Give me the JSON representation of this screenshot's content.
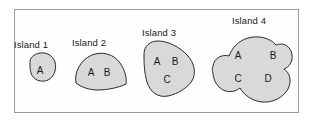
{
  "figure": {
    "background_color": "#ffffff",
    "frame": {
      "name": "outer-frame",
      "fill": "#fefefe",
      "stroke": "#9a9a9a",
      "x": 14,
      "y": 9,
      "width": 284,
      "height": 103
    },
    "island_fill": "#d9d9d9",
    "island_stroke": "#2b2b2b",
    "text_color": "#1a1a1a"
  },
  "islands": [
    {
      "label": "Island 1",
      "label_x": 14,
      "label_y": 48,
      "letters": [
        {
          "text": "A",
          "x": 40,
          "y": 74
        }
      ]
    },
    {
      "label": "Island 2",
      "label_x": 72,
      "label_y": 46,
      "letters": [
        {
          "text": "A",
          "x": 91,
          "y": 76
        },
        {
          "text": "B",
          "x": 107,
          "y": 76
        }
      ]
    },
    {
      "label": "Island 3",
      "label_x": 142,
      "label_y": 36,
      "letters": [
        {
          "text": "A",
          "x": 157,
          "y": 65
        },
        {
          "text": "B",
          "x": 175,
          "y": 65
        },
        {
          "text": "C",
          "x": 167,
          "y": 83
        }
      ]
    },
    {
      "label": "Island 4",
      "label_x": 232,
      "label_y": 24,
      "letters": [
        {
          "text": "A",
          "x": 238,
          "y": 59
        },
        {
          "text": "B",
          "x": 273,
          "y": 59
        },
        {
          "text": "C",
          "x": 238,
          "y": 82
        },
        {
          "text": "D",
          "x": 268,
          "y": 82
        }
      ]
    }
  ],
  "shapes": {
    "island1_path": "M 30,64 C 29,58 34,54 40,53 C 47,52 53,56 55,62 C 57,69 54,77 48,80 C 41,83 33,80 31,73 C 30,70 30,67 30,64 Z",
    "island2_path": "M 76,83 C 74,73 80,60 92,55 C 102,51 114,54 120,63 C 125,70 127,78 126,84 C 118,88 106,90 98,90 C 89,90 81,87 76,83 Z",
    "island3_path": "M 144,54 C 144,46 150,41 158,41 C 168,41 180,47 188,56 C 194,63 196,72 193,79 C 189,87 178,94 168,96 C 158,98 150,92 147,82 C 144,72 144,62 144,54 Z",
    "island4_path": "M 213,66 C 214,58 222,54 229,56 C 232,48 238,41 248,38 C 259,35 270,38 276,45 C 283,42 291,46 292,55 C 293,62 289,67 284,69 C 290,73 292,81 288,89 C 283,98 272,103 262,102 C 252,101 244,95 240,88 C 234,93 225,93 219,87 C 215,83 213,77 213,73 C 212,71 212,68 213,66 Z"
  }
}
